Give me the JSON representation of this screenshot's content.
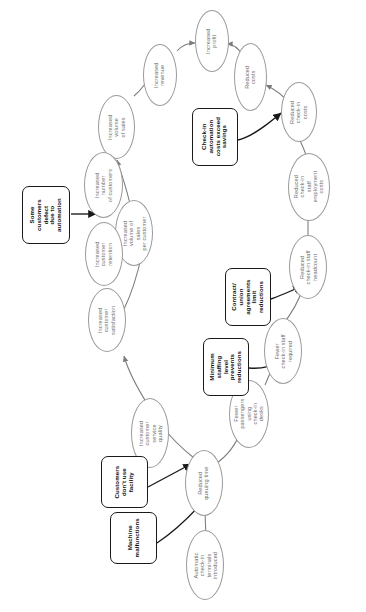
{
  "diagram": {
    "orientation": "rotated-90-ccw",
    "canvas": {
      "width": 366,
      "height": 612
    },
    "styles": {
      "ellipse_stroke": "#9a9a9a",
      "ellipse_text": "#6f6f6f",
      "box_stroke": "#1a1a1a",
      "box_text": "#111111",
      "edge_stroke": "#7b7b7b",
      "emphasis_edge_stroke": "#1a1a1a",
      "background": "#ffffff"
    },
    "ellipses": [
      {
        "id": "profit",
        "label": "Increased\nprofit"
      },
      {
        "id": "revenue",
        "label": "Increased\nrevenue"
      },
      {
        "id": "reduced_costs",
        "label": "Reduced costs"
      },
      {
        "id": "volume_sales",
        "label": "Increased\nvolume\nof sales"
      },
      {
        "id": "ci_costs",
        "label": "Reduced\ncheck-in\ncosts"
      },
      {
        "id": "num_customers",
        "label": "Increased\nnumber\nof customers"
      },
      {
        "id": "sales_per_cust",
        "label": "Increased\nvolume of sales\nper customer"
      },
      {
        "id": "staff_emp_costs",
        "label": "Reduced\ncheck-in\nstaff employment\ncosts"
      },
      {
        "id": "retention",
        "label": "Increased\ncustomer\nretention"
      },
      {
        "id": "headcount",
        "label": "Reduced\ncheck-in staff\nheadcount"
      },
      {
        "id": "satisfaction",
        "label": "Increased\ncustomer\nsatisfaction"
      },
      {
        "id": "fewer_staff",
        "label": "Fewer\ncheck-in staff\nrequired"
      },
      {
        "id": "service_quality",
        "label": "Increased\ncustomer service\nquality"
      },
      {
        "id": "fewer_pax",
        "label": "Fewer\npassengers using\ncheck-in\ndesks"
      },
      {
        "id": "queuing",
        "label": "Reduced\nqueuing time"
      },
      {
        "id": "terminals",
        "label": "Automatic\ncheck-in terminals\nintroduced"
      }
    ],
    "boxes": [
      {
        "id": "defect",
        "label": "Some\ncustomers\ndefect\ndue to\nautomation"
      },
      {
        "id": "exceed",
        "label": "Check-in\nautomation\ncosts exceed\nsavings"
      },
      {
        "id": "contract",
        "label": "Contract/\nunion\nagreements\nlimit\nreductions"
      },
      {
        "id": "minstaff",
        "label": "Minimum\nstaffing\nlevel\nprevents\nreductions"
      },
      {
        "id": "dontuse",
        "label": "Customers\ndon't use\nfacility"
      },
      {
        "id": "malfunc",
        "label": "Machine\nmalfunctions"
      }
    ],
    "edges": [
      {
        "from": "revenue",
        "to": "profit",
        "kind": "normal"
      },
      {
        "from": "reduced_costs",
        "to": "profit",
        "kind": "normal"
      },
      {
        "from": "volume_sales",
        "to": "revenue",
        "kind": "normal"
      },
      {
        "from": "ci_costs",
        "to": "reduced_costs",
        "kind": "normal"
      },
      {
        "from": "num_customers",
        "to": "volume_sales",
        "kind": "normal"
      },
      {
        "from": "sales_per_cust",
        "to": "volume_sales",
        "kind": "normal"
      },
      {
        "from": "staff_emp_costs",
        "to": "ci_costs",
        "kind": "normal"
      },
      {
        "from": "retention",
        "to": "num_customers",
        "kind": "normal"
      },
      {
        "from": "headcount",
        "to": "staff_emp_costs",
        "kind": "normal"
      },
      {
        "from": "satisfaction",
        "to": "retention",
        "kind": "normal"
      },
      {
        "from": "satisfaction",
        "to": "sales_per_cust",
        "kind": "normal"
      },
      {
        "from": "fewer_staff",
        "to": "headcount",
        "kind": "normal"
      },
      {
        "from": "service_quality",
        "to": "satisfaction",
        "kind": "normal"
      },
      {
        "from": "fewer_pax",
        "to": "fewer_staff",
        "kind": "normal"
      },
      {
        "from": "queuing",
        "to": "service_quality",
        "kind": "normal"
      },
      {
        "from": "queuing",
        "to": "fewer_pax",
        "kind": "normal"
      },
      {
        "from": "terminals",
        "to": "queuing",
        "kind": "normal"
      },
      {
        "from": "defect",
        "to": "num_customers",
        "kind": "emphasis"
      },
      {
        "from": "exceed",
        "to": "ci_costs",
        "kind": "emphasis"
      },
      {
        "from": "contract",
        "to": "headcount",
        "kind": "emphasis"
      },
      {
        "from": "minstaff",
        "to": "fewer_staff",
        "kind": "emphasis"
      },
      {
        "from": "dontuse",
        "to": "service_quality",
        "kind": "emphasis"
      },
      {
        "from": "malfunc",
        "to": "queuing",
        "kind": "emphasis"
      }
    ]
  }
}
